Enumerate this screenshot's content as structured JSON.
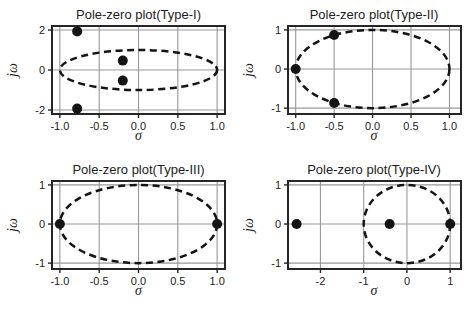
{
  "figure": {
    "background": "#ffffff",
    "text_color": "#1c1c1c",
    "grid_color": "#989898",
    "box_color": "#262626",
    "ellipse_color": "#141414",
    "marker_color": "#141414"
  },
  "chart_data": [
    {
      "type": "scatter",
      "title": "Pole-zero plot(Type-I)",
      "xlabel": "σ",
      "ylabel": "jω",
      "xlim": [
        -1.1,
        1.1
      ],
      "ylim": [
        -2.2,
        2.2
      ],
      "grid": true,
      "xticks": {
        "values": [
          -1.0,
          -0.5,
          0.0,
          0.5,
          1.0
        ],
        "labels": [
          "-1.0",
          "-0.5",
          "0.0",
          "0.5",
          "1.0"
        ]
      },
      "yticks": {
        "values": [
          2,
          0,
          -2
        ],
        "labels": [
          "2",
          "0",
          "-2"
        ]
      },
      "unit_circle": {
        "cx": 0,
        "cy": 0,
        "rx": 1,
        "ry": 1,
        "style": "dashed"
      },
      "marker": "filled-circle",
      "points": [
        [
          -0.78,
          1.93
        ],
        [
          -0.2,
          0.47
        ],
        [
          -0.2,
          -0.53
        ],
        [
          -0.78,
          -1.93
        ]
      ]
    },
    {
      "type": "scatter",
      "title": "Pole-zero plot(Type-II)",
      "xlabel": "σ",
      "ylabel": "jω",
      "xlim": [
        -1.1,
        1.15
      ],
      "ylim": [
        -1.15,
        1.1
      ],
      "grid": true,
      "xticks": {
        "values": [
          -1.0,
          -0.5,
          0.0,
          0.5,
          1.0
        ],
        "labels": [
          "-1.0",
          "-0.5",
          "0.0",
          "0.5",
          "1.0"
        ]
      },
      "yticks": {
        "values": [
          1,
          0,
          -1
        ],
        "labels": [
          "1",
          "0",
          "-1"
        ]
      },
      "unit_circle": {
        "cx": 0,
        "cy": 0,
        "rx": 1,
        "ry": 1,
        "style": "dashed"
      },
      "marker": "filled-circle",
      "points": [
        [
          -1.0,
          0
        ],
        [
          -0.5,
          0.87
        ],
        [
          -0.5,
          -0.87
        ]
      ]
    },
    {
      "type": "scatter",
      "title": "Pole-zero plot(Type-III)",
      "xlabel": "σ",
      "ylabel": "jω",
      "xlim": [
        -1.1,
        1.1
      ],
      "ylim": [
        -1.15,
        1.1
      ],
      "grid": true,
      "xticks": {
        "values": [
          -1.0,
          -0.5,
          0.0,
          0.5,
          1.0
        ],
        "labels": [
          "-1.0",
          "-0.5",
          "0.0",
          "0.5",
          "1.0"
        ]
      },
      "yticks": {
        "values": [
          1,
          0,
          -1
        ],
        "labels": [
          "1",
          "0",
          "-1"
        ]
      },
      "unit_circle": {
        "cx": 0,
        "cy": 0,
        "rx": 1,
        "ry": 1,
        "style": "dashed"
      },
      "marker": "filled-circle",
      "points": [
        [
          -1.0,
          0
        ],
        [
          1.0,
          0
        ]
      ]
    },
    {
      "type": "scatter",
      "title": "Pole-zero plot(Type-IV)",
      "xlabel": "σ",
      "ylabel": "jω",
      "xlim": [
        -2.75,
        1.25
      ],
      "ylim": [
        -1.15,
        1.1
      ],
      "grid": true,
      "xticks": {
        "values": [
          -2,
          -1,
          0,
          1
        ],
        "labels": [
          "-2",
          "-1",
          "0",
          "1"
        ]
      },
      "yticks": {
        "values": [
          1,
          0,
          -1
        ],
        "labels": [
          "1",
          "0",
          "-1"
        ]
      },
      "unit_circle": {
        "cx": 0,
        "cy": 0,
        "rx": 1,
        "ry": 1,
        "style": "dashed"
      },
      "marker": "filled-circle",
      "points": [
        [
          -2.55,
          0
        ],
        [
          -0.4,
          0
        ],
        [
          1.0,
          0
        ]
      ]
    }
  ]
}
